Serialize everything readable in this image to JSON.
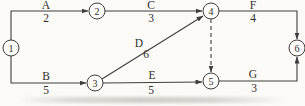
{
  "diagram": {
    "type": "activity-on-arrow-network",
    "canvas": {
      "width": 305,
      "height": 106
    },
    "style": {
      "background": "#fbfaf6",
      "line_color": "#3f3f3f",
      "text_color": "#2e2e2e",
      "node_fill": "#fcfbf8",
      "node_radius": 8,
      "label_font_size": 11.5,
      "node_font_size": 10
    },
    "nodes": [
      {
        "id": "1",
        "x": 11,
        "y": 48
      },
      {
        "id": "2",
        "x": 97,
        "y": 11
      },
      {
        "id": "3",
        "x": 95,
        "y": 83
      },
      {
        "id": "4",
        "x": 211,
        "y": 11
      },
      {
        "id": "5",
        "x": 211,
        "y": 81
      },
      {
        "id": "6",
        "x": 297,
        "y": 48
      }
    ],
    "edges": [
      {
        "name": "A",
        "duration": "2",
        "from": "1",
        "to": "2",
        "dashed": false,
        "points": [
          [
            11,
            40
          ],
          [
            11,
            11
          ],
          [
            88,
            11
          ]
        ],
        "name_pos": [
          46,
          9
        ],
        "duration_pos": [
          46,
          22
        ]
      },
      {
        "name": "B",
        "duration": "5",
        "from": "1",
        "to": "3",
        "dashed": false,
        "points": [
          [
            11,
            56
          ],
          [
            11,
            83
          ],
          [
            86,
            83
          ]
        ],
        "name_pos": [
          46,
          80
        ],
        "duration_pos": [
          46,
          94
        ]
      },
      {
        "name": "C",
        "duration": "3",
        "from": "2",
        "to": "4",
        "dashed": false,
        "points": [
          [
            105,
            11
          ],
          [
            202,
            11
          ]
        ],
        "name_pos": [
          151,
          9
        ],
        "duration_pos": [
          151,
          22
        ]
      },
      {
        "name": "D",
        "duration": "6",
        "from": "3",
        "to": "4",
        "dashed": false,
        "points": [
          [
            102,
            79
          ],
          [
            203,
            16
          ]
        ],
        "name_pos": [
          139,
          47
        ],
        "duration_pos": [
          146,
          58
        ]
      },
      {
        "name": "E",
        "duration": "5",
        "from": "3",
        "to": "5",
        "dashed": false,
        "points": [
          [
            103,
            83
          ],
          [
            202,
            82
          ]
        ],
        "name_pos": [
          152,
          79
        ],
        "duration_pos": [
          151,
          94
        ]
      },
      {
        "name": "",
        "duration": "",
        "from": "4",
        "to": "5",
        "dashed": true,
        "points": [
          [
            211,
            19
          ],
          [
            211,
            72
          ]
        ]
      },
      {
        "name": "F",
        "duration": "4",
        "from": "4",
        "to": "6",
        "dashed": false,
        "points": [
          [
            219,
            11
          ],
          [
            297,
            11
          ],
          [
            297,
            39
          ]
        ],
        "name_pos": [
          253,
          9
        ],
        "duration_pos": [
          253,
          22
        ]
      },
      {
        "name": "G",
        "duration": "3",
        "from": "5",
        "to": "6",
        "dashed": false,
        "points": [
          [
            219,
            81
          ],
          [
            297,
            81
          ],
          [
            297,
            57
          ]
        ],
        "name_pos": [
          253,
          78
        ],
        "duration_pos": [
          254,
          92
        ]
      }
    ]
  }
}
